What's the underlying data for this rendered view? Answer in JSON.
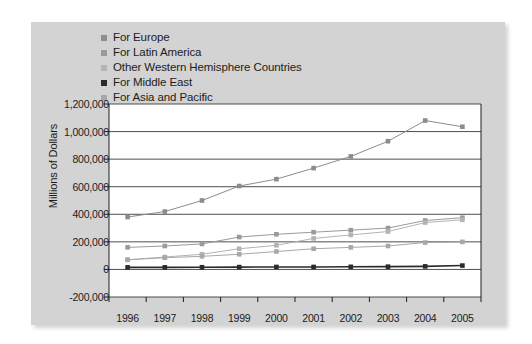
{
  "chart_data": {
    "type": "line",
    "title": "",
    "xlabel": "",
    "ylabel": "Millions of Dollars",
    "categories": [
      "1996",
      "1997",
      "1998",
      "1999",
      "2000",
      "2001",
      "2002",
      "2003",
      "2004",
      "2005"
    ],
    "ylim": [
      -200000,
      1200000
    ],
    "ytick_step": 200000,
    "yticks": [
      "1,200,000",
      "1,000,000",
      "800,000",
      "600,000",
      "400,000",
      "200,000",
      "0",
      "-200,000"
    ],
    "ytick_values": [
      1200000,
      1000000,
      800000,
      600000,
      400000,
      200000,
      0,
      -200000
    ],
    "grid": true,
    "legend_position": "top-left",
    "series": [
      {
        "name": "For Europe",
        "color": "#8c8c8c",
        "values": [
          380000,
          420000,
          500000,
          605000,
          655000,
          735000,
          820000,
          930000,
          1080000,
          1035000
        ]
      },
      {
        "name": "For Latin America",
        "color": "#9a9a9a",
        "values": [
          160000,
          170000,
          185000,
          235000,
          255000,
          270000,
          285000,
          300000,
          355000,
          375000
        ]
      },
      {
        "name": "Other Western Hemisphere Countries",
        "color": "#b4b4b4",
        "values": [
          70000,
          90000,
          110000,
          150000,
          175000,
          225000,
          250000,
          275000,
          340000,
          360000
        ]
      },
      {
        "name": "For Middle East",
        "color": "#2b2b2b",
        "values": [
          15000,
          15000,
          16000,
          17000,
          18000,
          18000,
          19000,
          20000,
          22000,
          28000
        ]
      },
      {
        "name": "For Asia and Pacific",
        "color": "#a8a8a8",
        "values": [
          70000,
          85000,
          95000,
          110000,
          130000,
          150000,
          160000,
          170000,
          195000,
          200000
        ]
      }
    ]
  },
  "colors": {
    "card_background": "#d3d3d3",
    "plot_background": "#ffffff",
    "axis": "#1c1c1c",
    "grid": "#3a3a3a",
    "text": "#1c1c1c"
  }
}
